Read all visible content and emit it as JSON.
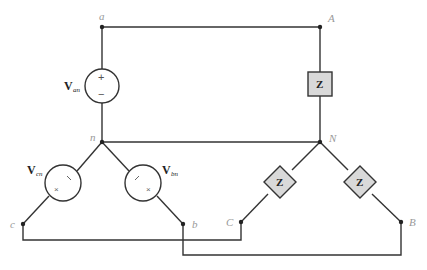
{
  "diagram": {
    "nodes": {
      "a": "a",
      "n": "n",
      "c": "c",
      "b": "b",
      "A": "A",
      "N": "N",
      "C": "C",
      "B": "B"
    },
    "sources": [
      {
        "id": "Van",
        "symbol": "V",
        "subscript": "an",
        "plus": "+",
        "minus": "−"
      },
      {
        "id": "Vcn",
        "symbol": "V",
        "subscript": "cn"
      },
      {
        "id": "Vbn",
        "symbol": "V",
        "subscript": "bn"
      }
    ],
    "impedances": [
      {
        "id": "Z_A",
        "label": "Z"
      },
      {
        "id": "Z_C",
        "label": "Z"
      },
      {
        "id": "Z_B",
        "label": "Z"
      }
    ],
    "polarity_marks": {
      "plus_tick": "/",
      "minus_cross": "×"
    }
  }
}
